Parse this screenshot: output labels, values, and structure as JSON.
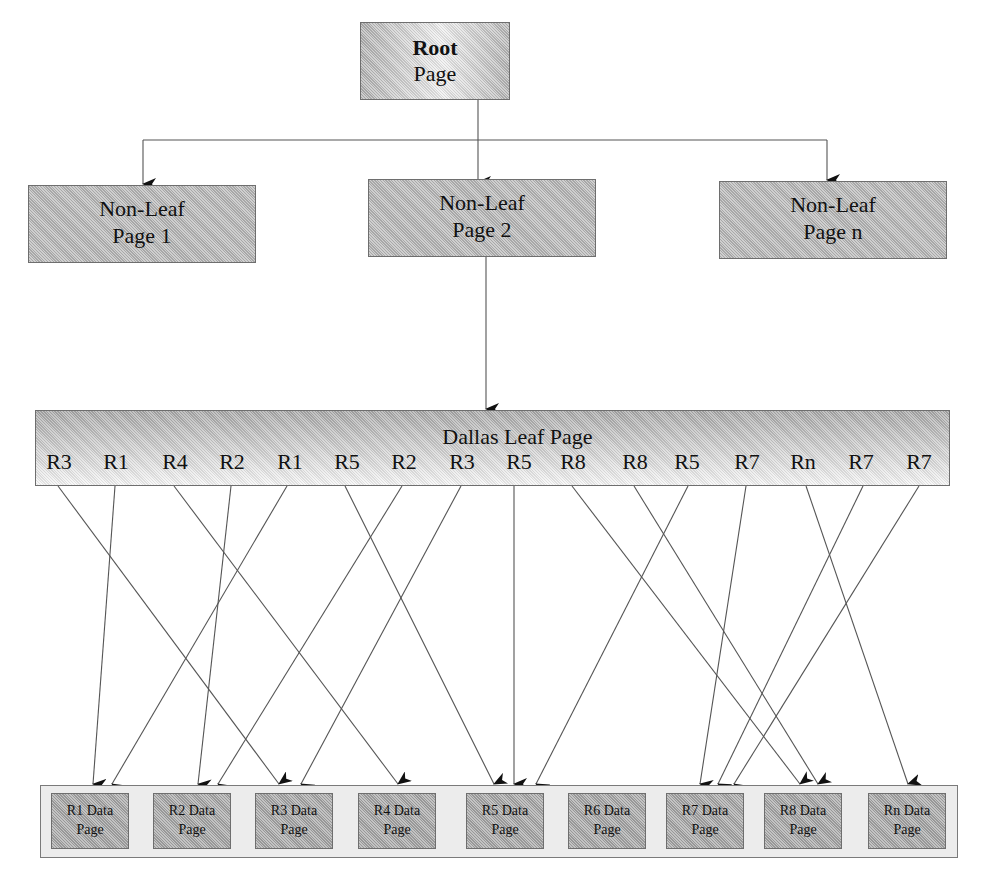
{
  "diagram": {
    "type": "b-tree index structure",
    "root": {
      "line1": "Root",
      "line2": "Page"
    },
    "non_leaf_pages": [
      {
        "line1": "Non-Leaf",
        "line2": "Page 1"
      },
      {
        "line1": "Non-Leaf",
        "line2": "Page 2"
      },
      {
        "line1": "Non-Leaf",
        "line2": "Page n"
      }
    ],
    "leaf_page": {
      "title": "Dallas Leaf Page",
      "entries": [
        "R3",
        "R1",
        "R4",
        "R2",
        "R1",
        "R5",
        "R2",
        "R3",
        "R5",
        "R8",
        "R8",
        "R5",
        "R7",
        "Rn",
        "R7",
        "R7"
      ]
    },
    "data_pages": [
      {
        "line1": "R1 Data",
        "line2": "Page"
      },
      {
        "line1": "R2 Data",
        "line2": "Page"
      },
      {
        "line1": "R3 Data",
        "line2": "Page"
      },
      {
        "line1": "R4 Data",
        "line2": "Page"
      },
      {
        "line1": "R5 Data",
        "line2": "Page"
      },
      {
        "line1": "R6 Data",
        "line2": "Page"
      },
      {
        "line1": "R7 Data",
        "line2": "Page"
      },
      {
        "line1": "R8 Data",
        "line2": "Page"
      },
      {
        "line1": "Rn Data",
        "line2": "Page"
      }
    ],
    "edges": [
      {
        "from": "Root Page",
        "to": "Non-Leaf Page 1"
      },
      {
        "from": "Root Page",
        "to": "Non-Leaf Page 2"
      },
      {
        "from": "Root Page",
        "to": "Non-Leaf Page n"
      },
      {
        "from": "Non-Leaf Page 2",
        "to": "Dallas Leaf Page"
      },
      {
        "from": "R3",
        "to": "R3 Data Page"
      },
      {
        "from": "R1",
        "to": "R1 Data Page"
      },
      {
        "from": "R4",
        "to": "R4 Data Page"
      },
      {
        "from": "R2",
        "to": "R2 Data Page"
      },
      {
        "from": "R1",
        "to": "R1 Data Page"
      },
      {
        "from": "R5",
        "to": "R5 Data Page"
      },
      {
        "from": "R2",
        "to": "R2 Data Page"
      },
      {
        "from": "R3",
        "to": "R3 Data Page"
      },
      {
        "from": "R5",
        "to": "R5 Data Page"
      },
      {
        "from": "R8",
        "to": "R8 Data Page"
      },
      {
        "from": "R8",
        "to": "R8 Data Page"
      },
      {
        "from": "R5",
        "to": "R5 Data Page"
      },
      {
        "from": "R7",
        "to": "R7 Data Page"
      },
      {
        "from": "Rn",
        "to": "Rn Data Page"
      },
      {
        "from": "R7",
        "to": "R7 Data Page"
      },
      {
        "from": "R7",
        "to": "R7 Data Page"
      }
    ]
  }
}
